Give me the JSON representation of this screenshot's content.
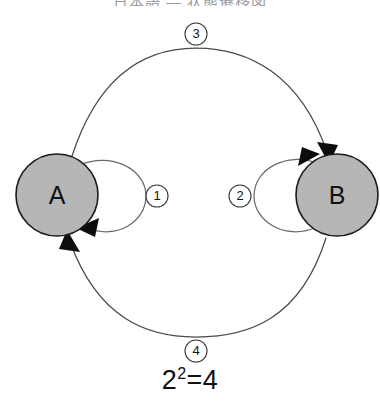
{
  "diagram": {
    "title_top": "日本語 — 状態遷移図",
    "formula": {
      "base": "2",
      "exponent": "2",
      "equals": "=",
      "result": "4",
      "full": "2²=4"
    },
    "nodes": [
      {
        "id": "A",
        "label": "A",
        "cx": 57,
        "cy": 195,
        "r": 41,
        "fill": "#b6b6b6",
        "stroke": "#1a1a1a"
      },
      {
        "id": "B",
        "label": "B",
        "cx": 337,
        "cy": 195,
        "r": 41,
        "fill": "#b6b6b6",
        "stroke": "#1a1a1a"
      }
    ],
    "edges": [
      {
        "id": "loop-a",
        "badge": "①",
        "number": "1",
        "from": "A",
        "to": "A",
        "kind": "self-loop",
        "side": "right"
      },
      {
        "id": "loop-b",
        "badge": "②",
        "number": "2",
        "from": "B",
        "to": "B",
        "kind": "self-loop",
        "side": "left"
      },
      {
        "id": "arc-top",
        "badge": "③",
        "number": "3",
        "from": "A",
        "to": "B",
        "kind": "arc",
        "side": "top"
      },
      {
        "id": "arc-bottom",
        "badge": "④",
        "number": "4",
        "from": "B",
        "to": "A",
        "kind": "arc",
        "side": "bottom"
      }
    ],
    "badges": [
      {
        "id": "badge-1",
        "text": "1",
        "cx": 157,
        "cy": 196,
        "r": 11
      },
      {
        "id": "badge-2",
        "text": "2",
        "cx": 240,
        "cy": 196,
        "r": 11
      },
      {
        "id": "badge-3",
        "text": "3",
        "cx": 196,
        "cy": 34,
        "r": 11
      },
      {
        "id": "badge-4",
        "text": "4",
        "cx": 196,
        "cy": 351,
        "r": 11
      }
    ],
    "colors": {
      "node_fill": "#b6b6b6",
      "node_stroke": "#1a1a1a",
      "edge_stroke": "#4a4a4a",
      "loop_stroke": "#6a6a6a",
      "arrow_fill": "#0d0d0d",
      "badge_fill": "#ffffff",
      "badge_stroke": "#3a3a3a",
      "text": "#111111",
      "background": "#ffffff"
    }
  }
}
